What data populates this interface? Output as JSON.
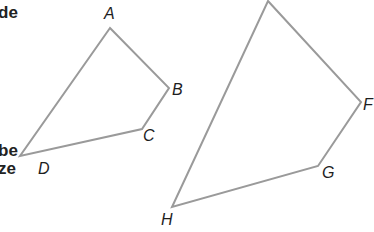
{
  "text_fragments": {
    "top": "de",
    "middle_1": "be",
    "middle_2": "ze"
  },
  "colors": {
    "stroke": "#9a9a9a",
    "label": "#1e1e1e",
    "text": "#222222",
    "background": "#ffffff"
  },
  "quadrilaterals": [
    {
      "name": "ABCD",
      "vertices": [
        {
          "label": "A",
          "x": 110,
          "y": 28
        },
        {
          "label": "B",
          "x": 169,
          "y": 88
        },
        {
          "label": "C",
          "x": 142,
          "y": 129
        },
        {
          "label": "D",
          "x": 20,
          "y": 156
        }
      ]
    },
    {
      "name": "EFGH",
      "vertices": [
        {
          "label": "",
          "x": 268,
          "y": 1
        },
        {
          "label": "F",
          "x": 361,
          "y": 102
        },
        {
          "label": "G",
          "x": 318,
          "y": 166
        },
        {
          "label": "H",
          "x": 172,
          "y": 207
        }
      ]
    }
  ],
  "labels": {
    "A": "A",
    "B": "B",
    "C": "C",
    "D": "D",
    "F": "F",
    "G": "G",
    "H": "H"
  }
}
